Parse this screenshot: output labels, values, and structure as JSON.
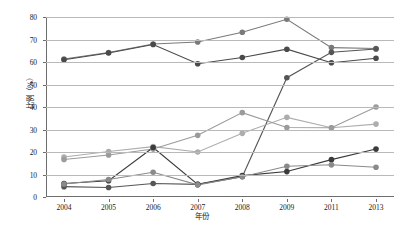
{
  "chart_data": {
    "type": "line",
    "title": "",
    "xlabel": "年份",
    "ylabel": "比例（%）",
    "categories": [
      "2004",
      "2005",
      "2006",
      "2007",
      "2008",
      "2009",
      "2011",
      "2013"
    ],
    "ylim": [
      0,
      80
    ],
    "yticks": [
      0,
      10,
      20,
      30,
      40,
      50,
      60,
      70,
      80
    ],
    "grid": "horizontal",
    "legend_position": "none",
    "series": [
      {
        "name": "series-1",
        "color": "#7a7a7a",
        "values": [
          61.3,
          64.2,
          68.0,
          68.9,
          73.2,
          79.0,
          66.4,
          66.0
        ]
      },
      {
        "name": "series-2",
        "color": "#4a4a4a",
        "values": [
          61.0,
          64.0,
          67.8,
          59.2,
          62.0,
          65.7,
          59.7,
          61.7
        ]
      },
      {
        "name": "series-3",
        "color": "#555555",
        "values": [
          4.6,
          4.2,
          6.0,
          5.6,
          9.0,
          53.0,
          64.3,
          65.8
        ]
      },
      {
        "name": "series-4",
        "color": "#adadad",
        "values": [
          17.8,
          20.2,
          22.4,
          20.0,
          28.3,
          35.4,
          30.8,
          32.4
        ]
      },
      {
        "name": "series-5",
        "color": "#9b9b9b",
        "values": [
          16.7,
          18.7,
          21.3,
          27.4,
          37.5,
          30.9,
          30.8,
          40.0
        ]
      },
      {
        "name": "series-6",
        "color": "#3b3b3b",
        "values": [
          6.0,
          7.2,
          22.0,
          5.6,
          9.5,
          11.3,
          16.6,
          21.3
        ]
      },
      {
        "name": "series-7",
        "color": "#8a8a8a",
        "values": [
          5.8,
          7.8,
          11.0,
          5.4,
          9.0,
          13.7,
          14.3,
          13.2
        ]
      }
    ]
  },
  "axes": {
    "ylabel_text": "比例（%）",
    "xlabel_text": "年份",
    "ytick_labels": [
      "0",
      "10",
      "20",
      "30",
      "40",
      "50",
      "60",
      "70",
      "80"
    ],
    "xtick_labels": [
      "2004",
      "2005",
      "2006",
      "2007",
      "2008",
      "2009",
      "2011",
      "2013"
    ]
  },
  "caption": {
    "text": ""
  }
}
